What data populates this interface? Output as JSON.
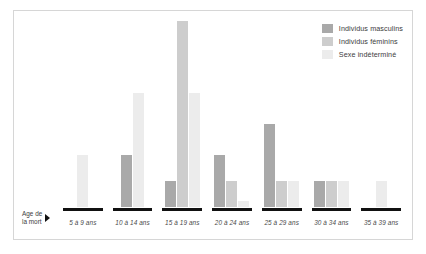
{
  "axis": {
    "title": "Age de\nla mort",
    "arrow_icon": "right-arrow-icon"
  },
  "legend": {
    "items": [
      {
        "label": "Individus masculins",
        "color": "#a9a9a9",
        "key": "male"
      },
      {
        "label": "Individus féminins",
        "color": "#cdcdcd",
        "key": "female"
      },
      {
        "label": "Sexe indéterminé",
        "color": "#ececec",
        "key": "unknown"
      }
    ]
  },
  "chart_data": {
    "type": "bar",
    "title": "",
    "subtitle": "",
    "xlabel": "Age de la mort",
    "ylabel": "",
    "grid": false,
    "legend_position": "top-right",
    "ylim": [
      0,
      18
    ],
    "categories": [
      "5 à 9 ans",
      "10 à 14 ans",
      "15 à 19 ans",
      "20 à 24 ans",
      "25 à 29 ans",
      "30 à 34 ans",
      "35 à 39 ans"
    ],
    "series": [
      {
        "name": "Individus masculins",
        "color": "#a9a9a9",
        "values": [
          0,
          5,
          2.5,
          5,
          8,
          2.5,
          0
        ]
      },
      {
        "name": "Individus féminins",
        "color": "#cdcdcd",
        "values": [
          0,
          0,
          18,
          2.5,
          2.5,
          2.5,
          0
        ]
      },
      {
        "name": "Sexe indéterminé",
        "color": "#ececec",
        "values": [
          5,
          11,
          11,
          0.6,
          2.5,
          2.5,
          2.5
        ]
      }
    ]
  }
}
